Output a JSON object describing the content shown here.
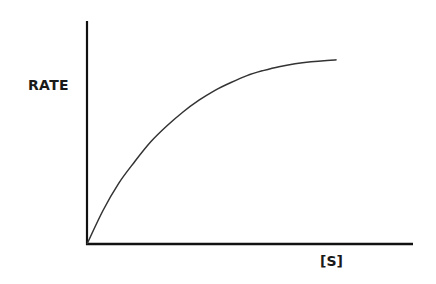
{
  "chart_data": {
    "type": "line",
    "title": "",
    "xlabel": "[S]",
    "ylabel": "RATE",
    "grid": false,
    "legend": null,
    "x_ticks": [],
    "y_ticks": [],
    "series": [
      {
        "name": "rate",
        "x": [
          0,
          0.05,
          0.1,
          0.15,
          0.2,
          0.25,
          0.3,
          0.35,
          0.4,
          0.45,
          0.5,
          0.55,
          0.6,
          0.65,
          0.7,
          0.75,
          0.78
        ],
        "y": [
          0,
          0.17,
          0.31,
          0.42,
          0.52,
          0.6,
          0.67,
          0.73,
          0.78,
          0.82,
          0.855,
          0.88,
          0.9,
          0.915,
          0.925,
          0.932,
          0.935
        ]
      }
    ],
    "xlim": [
      0,
      1
    ],
    "ylim": [
      0,
      1
    ]
  },
  "labels": {
    "y_axis": "RATE",
    "x_axis": "[S]"
  },
  "style": {
    "axis_color": "#111111",
    "curve_color": "#333333",
    "background": "#ffffff"
  }
}
